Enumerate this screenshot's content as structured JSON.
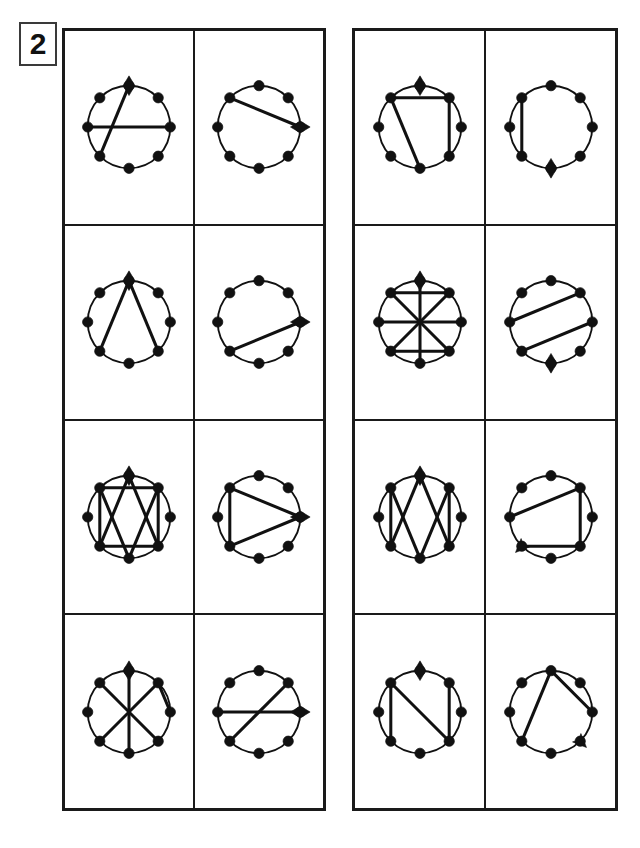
{
  "figure": {
    "label": "2",
    "caption_none": "",
    "colors": {
      "ink": "#111111",
      "border": "#1a1a1a",
      "background": "#ffffff"
    },
    "node_count_per_circle": 8,
    "node_angles_deg": [
      270,
      315,
      0,
      45,
      90,
      135,
      180,
      225
    ],
    "node_index_names": [
      "top",
      "upper-right",
      "right",
      "lower-right",
      "bottom",
      "lower-left",
      "left",
      "upper-left"
    ]
  },
  "panels": [
    {
      "name": "left-panel",
      "rows": [
        {
          "name": "row-1",
          "cells": [
            {
              "name": "cell-1-1",
              "marker": {
                "node": 0,
                "type": "diamond"
              },
              "edges": [
                [
                  6,
                  2
                ],
                [
                  5,
                  0
                ]
              ]
            },
            {
              "name": "cell-1-2",
              "marker": {
                "node": 2,
                "type": "diamond"
              },
              "edges": [
                [
                  7,
                  2
                ]
              ]
            }
          ]
        },
        {
          "name": "row-2",
          "cells": [
            {
              "name": "cell-2-1",
              "marker": {
                "node": 0,
                "type": "diamond"
              },
              "edges": [
                [
                  0,
                  5
                ],
                [
                  0,
                  3
                ]
              ]
            },
            {
              "name": "cell-2-2",
              "marker": {
                "node": 2,
                "type": "diamond"
              },
              "edges": [
                [
                  5,
                  2
                ]
              ]
            }
          ]
        },
        {
          "name": "row-3",
          "cells": [
            {
              "name": "cell-3-1",
              "marker": {
                "node": 0,
                "type": "diamond"
              },
              "edges": [
                [
                  7,
                  1
                ],
                [
                  5,
                  3
                ],
                [
                  7,
                  4
                ],
                [
                  1,
                  4
                ],
                [
                  7,
                  5
                ],
                [
                  1,
                  3
                ],
                [
                  0,
                  5
                ],
                [
                  0,
                  3
                ]
              ]
            },
            {
              "name": "cell-3-2",
              "marker": {
                "node": 2,
                "type": "diamond"
              },
              "edges": [
                [
                  7,
                  5
                ],
                [
                  7,
                  2
                ],
                [
                  5,
                  2
                ]
              ]
            }
          ]
        },
        {
          "name": "row-4",
          "cells": [
            {
              "name": "cell-4-1",
              "marker": {
                "node": 0,
                "type": "diamond"
              },
              "edges": [
                [
                  0,
                  4
                ],
                [
                  7,
                  3
                ],
                [
                  1,
                  5
                ],
                [
                  1,
                  2
                ]
              ]
            },
            {
              "name": "cell-4-2",
              "marker": {
                "node": 2,
                "type": "diamond"
              },
              "edges": [
                [
                  6,
                  2
                ],
                [
                  5,
                  1
                ]
              ]
            }
          ]
        }
      ]
    },
    {
      "name": "right-panel",
      "rows": [
        {
          "name": "row-1",
          "cells": [
            {
              "name": "cell-1-1",
              "marker": {
                "node": 0,
                "type": "diamond"
              },
              "edges": [
                [
                  7,
                  1
                ],
                [
                  1,
                  3
                ],
                [
                  7,
                  4
                ]
              ]
            },
            {
              "name": "cell-1-2",
              "marker": {
                "node": 4,
                "type": "diamond"
              },
              "edges": [
                [
                  7,
                  5
                ]
              ]
            }
          ]
        },
        {
          "name": "row-2",
          "cells": [
            {
              "name": "cell-2-1",
              "marker": {
                "node": 0,
                "type": "diamond"
              },
              "edges": [
                [
                  0,
                  4
                ],
                [
                  7,
                  1
                ],
                [
                  5,
                  3
                ],
                [
                  7,
                  3
                ],
                [
                  1,
                  5
                ],
                [
                  6,
                  2
                ]
              ]
            },
            {
              "name": "cell-2-2",
              "marker": {
                "node": 4,
                "type": "diamond"
              },
              "edges": [
                [
                  6,
                  1
                ],
                [
                  5,
                  2
                ]
              ]
            }
          ]
        },
        {
          "name": "row-3",
          "cells": [
            {
              "name": "cell-3-1",
              "marker": {
                "node": 0,
                "type": "diamond"
              },
              "edges": [
                [
                  0,
                  3
                ],
                [
                  0,
                  5
                ],
                [
                  7,
                  4
                ],
                [
                  1,
                  4
                ],
                [
                  7,
                  5
                ],
                [
                  1,
                  3
                ]
              ]
            },
            {
              "name": "cell-3-2",
              "marker": {
                "node": 5,
                "type": "arrow"
              },
              "edges": [
                [
                  6,
                  1
                ],
                [
                  1,
                  3
                ],
                [
                  3,
                  5
                ]
              ]
            }
          ]
        },
        {
          "name": "row-4",
          "cells": [
            {
              "name": "cell-4-1",
              "marker": {
                "node": 0,
                "type": "diamond"
              },
              "edges": [
                [
                  7,
                  5
                ],
                [
                  1,
                  3
                ],
                [
                  7,
                  3
                ]
              ]
            },
            {
              "name": "cell-4-2",
              "marker": {
                "node": 3,
                "type": "arrow"
              },
              "edges": [
                [
                  0,
                  5
                ],
                [
                  0,
                  2
                ]
              ]
            }
          ]
        }
      ]
    }
  ]
}
